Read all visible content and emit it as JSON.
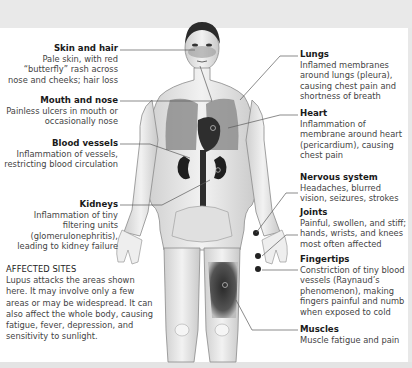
{
  "colors": {
    "background": "#ffffff",
    "band": "#e9e9e9",
    "heading": "#1a1a1a",
    "body_text": "#444444",
    "leader_line": "#555555",
    "marker": "#222222"
  },
  "labels_left": [
    {
      "heading": "Skin and hair",
      "text": "Pale skin, with red “butterfly” rash across nose and cheeks; hair loss"
    },
    {
      "heading": "Mouth and nose",
      "text": "Painless ulcers in mouth or occasionally nose"
    },
    {
      "heading": "Blood vessels",
      "text": "Inflammation of vessels, restricting blood circulation"
    },
    {
      "heading": "Kidneys",
      "text": "Inflammation of tiny filtering units (glomerulonephritis), leading to kidney failure"
    }
  ],
  "labels_right": [
    {
      "heading": "Lungs",
      "text": "Inflamed membranes around lungs (pleura), causing chest pain and shortness of breath"
    },
    {
      "heading": "Heart",
      "text": "Inflammation of membrane around heart (pericardium), causing chest pain"
    },
    {
      "heading": "Nervous system",
      "text": "Headaches, blurred vision, seizures, strokes"
    },
    {
      "heading": "Joints",
      "text": "Painful, swollen, and stiff; hands, wrists, and knees most often affected"
    },
    {
      "heading": "Fingertips",
      "text": "Constriction of tiny blood vessels (Raynaud’s phenomenon), making fingers painful and numb when exposed to cold"
    },
    {
      "heading": "Muscles",
      "text": "Muscle fatigue and pain"
    }
  ],
  "affected_sites": {
    "heading": "AFFECTED SITES",
    "text": "Lupus attacks the areas shown here. It may involve only a few areas or may be widespread. It can also affect the whole body, causing fatigue, fever, depression, and sensitivity to sunlight."
  }
}
